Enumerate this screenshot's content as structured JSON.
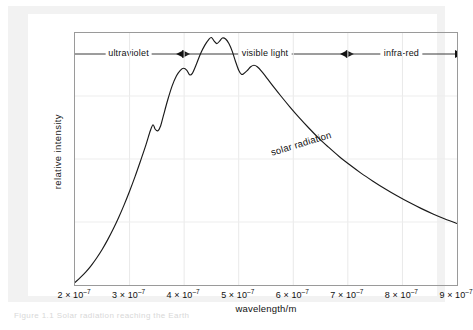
{
  "chart_data": {
    "type": "line",
    "title": "",
    "xlabel": "wavelength/m",
    "ylabel": "relative intensity",
    "xlim": [
      2e-07,
      9e-07
    ],
    "ylim": [
      0,
      1
    ],
    "grid": true,
    "legend": "none",
    "annotations": [
      {
        "text": "solar radiation",
        "x": 5.55e-07,
        "y": 0.58,
        "rotation": -17
      }
    ],
    "x_ticks": [
      {
        "value": 2e-07,
        "mantissa": "2",
        "multiplier": "× 10",
        "exponent": "–7",
        "label": "2 × 10⁻⁷"
      },
      {
        "value": 3e-07,
        "mantissa": "3",
        "multiplier": "× 10",
        "exponent": "–7",
        "label": "3 × 10⁻⁷"
      },
      {
        "value": 4e-07,
        "mantissa": "4",
        "multiplier": "× 10",
        "exponent": "–7",
        "label": "4 × 10⁻⁷"
      },
      {
        "value": 5e-07,
        "mantissa": "5",
        "multiplier": "× 10",
        "exponent": "–7",
        "label": "5 × 10⁻⁷"
      },
      {
        "value": 6e-07,
        "mantissa": "6",
        "multiplier": "× 10",
        "exponent": "–7",
        "label": "6 × 10⁻⁷"
      },
      {
        "value": 7e-07,
        "mantissa": "7",
        "multiplier": "× 10",
        "exponent": "–7",
        "label": "7 × 10⁻⁷"
      },
      {
        "value": 8e-07,
        "mantissa": "8",
        "multiplier": "× 10",
        "exponent": "–7",
        "label": "8 × 10⁻⁷"
      },
      {
        "value": 9e-07,
        "mantissa": "9",
        "multiplier": "× 10",
        "exponent": "–7",
        "label": "9 × 10⁻⁷"
      }
    ],
    "y_ticks": [],
    "spectral_bands": [
      {
        "label": "ultraviolet",
        "start": 2e-07,
        "end": 4e-07
      },
      {
        "label": "visible light",
        "start": 4e-07,
        "end": 7e-07
      },
      {
        "label": "infra-red",
        "start": 7e-07,
        "end": 9e-07
      }
    ],
    "series": [
      {
        "name": "solar radiation",
        "color": "#1a1a1a",
        "points": [
          [
            2e-07,
            0.01
          ],
          [
            2.1e-07,
            0.03
          ],
          [
            2.2e-07,
            0.052
          ],
          [
            2.3e-07,
            0.078
          ],
          [
            2.4e-07,
            0.108
          ],
          [
            2.5e-07,
            0.142
          ],
          [
            2.6e-07,
            0.18
          ],
          [
            2.7e-07,
            0.222
          ],
          [
            2.8e-07,
            0.268
          ],
          [
            2.9e-07,
            0.318
          ],
          [
            3e-07,
            0.372
          ],
          [
            3.1e-07,
            0.43
          ],
          [
            3.2e-07,
            0.492
          ],
          [
            3.3e-07,
            0.556
          ],
          [
            3.38e-07,
            0.612
          ],
          [
            3.43e-07,
            0.636
          ],
          [
            3.47e-07,
            0.618
          ],
          [
            3.52e-07,
            0.612
          ],
          [
            3.57e-07,
            0.632
          ],
          [
            3.62e-07,
            0.672
          ],
          [
            3.7e-07,
            0.735
          ],
          [
            3.78e-07,
            0.79
          ],
          [
            3.86e-07,
            0.83
          ],
          [
            3.93e-07,
            0.852
          ],
          [
            3.99e-07,
            0.86
          ],
          [
            4.05e-07,
            0.852
          ],
          [
            4.1e-07,
            0.834
          ],
          [
            4.15e-07,
            0.84
          ],
          [
            4.22e-07,
            0.874
          ],
          [
            4.3e-07,
            0.918
          ],
          [
            4.38e-07,
            0.952
          ],
          [
            4.45e-07,
            0.974
          ],
          [
            4.5e-07,
            0.982
          ],
          [
            4.55e-07,
            0.968
          ],
          [
            4.6e-07,
            0.958
          ],
          [
            4.65e-07,
            0.968
          ],
          [
            4.7e-07,
            0.98
          ],
          [
            4.76e-07,
            0.976
          ],
          [
            4.82e-07,
            0.958
          ],
          [
            4.88e-07,
            0.928
          ],
          [
            4.94e-07,
            0.888
          ],
          [
            5e-07,
            0.852
          ],
          [
            5.05e-07,
            0.836
          ],
          [
            5.1e-07,
            0.84
          ],
          [
            5.16e-07,
            0.852
          ],
          [
            5.22e-07,
            0.866
          ],
          [
            5.28e-07,
            0.872
          ],
          [
            5.34e-07,
            0.866
          ],
          [
            5.42e-07,
            0.848
          ],
          [
            5.52e-07,
            0.82
          ],
          [
            5.64e-07,
            0.786
          ],
          [
            5.78e-07,
            0.748
          ],
          [
            5.94e-07,
            0.706
          ],
          [
            6.1e-07,
            0.666
          ],
          [
            6.28e-07,
            0.624
          ],
          [
            6.46e-07,
            0.584
          ],
          [
            6.64e-07,
            0.548
          ],
          [
            6.84e-07,
            0.51
          ],
          [
            7.04e-07,
            0.476
          ],
          [
            7.24e-07,
            0.444
          ],
          [
            7.46e-07,
            0.412
          ],
          [
            7.68e-07,
            0.382
          ],
          [
            7.9e-07,
            0.354
          ],
          [
            8.12e-07,
            0.328
          ],
          [
            8.34e-07,
            0.304
          ],
          [
            8.56e-07,
            0.282
          ],
          [
            8.78e-07,
            0.262
          ],
          [
            9e-07,
            0.244
          ]
        ]
      }
    ]
  },
  "caption": {
    "text": "Figure 1.1  Solar radiation reaching the Earth"
  }
}
